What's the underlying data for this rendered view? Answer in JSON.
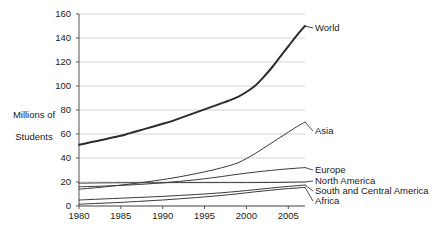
{
  "chart_data": {
    "type": "line",
    "title": "",
    "subtitle": "",
    "xlabel": "",
    "ylabel": "Millions of\nStudents",
    "xlim": [
      1980,
      2007
    ],
    "ylim": [
      0,
      160
    ],
    "grid": "horizontal",
    "legend_position": "right-inline-labels",
    "x_ticks": [
      "1980",
      "1985",
      "1990",
      "1995",
      "2000",
      "2005"
    ],
    "x_tick_values": [
      1980,
      1985,
      1990,
      1995,
      2000,
      2005
    ],
    "y_ticks": [
      "0",
      "20",
      "40",
      "60",
      "80",
      "100",
      "120",
      "140",
      "160"
    ],
    "y_tick_values": [
      0,
      20,
      40,
      60,
      80,
      100,
      120,
      140,
      160
    ],
    "x": [
      1980,
      1981,
      1982,
      1983,
      1984,
      1985,
      1986,
      1987,
      1988,
      1989,
      1990,
      1991,
      1992,
      1993,
      1994,
      1995,
      1996,
      1997,
      1998,
      1999,
      2000,
      2001,
      2002,
      2003,
      2004,
      2005,
      2006,
      2007
    ],
    "series": [
      {
        "name": "World",
        "color": "#2b2b2b",
        "width": 2.0,
        "label_x": 2007,
        "label_y": 150,
        "values": [
          51,
          52.5,
          54,
          55.5,
          57,
          58.5,
          60.5,
          62.5,
          64.5,
          66.5,
          68.5,
          70.5,
          73,
          75.5,
          78,
          80.5,
          83,
          85.5,
          88,
          91,
          95,
          100,
          107,
          115,
          124,
          133,
          142,
          150
        ]
      },
      {
        "name": "Asia",
        "color": "#3a3a3a",
        "width": 1.0,
        "label_x": 2007,
        "label_y": 70,
        "values": [
          14,
          14.6,
          15.2,
          15.9,
          16.6,
          17.4,
          18.2,
          19.1,
          20,
          21,
          22,
          23.1,
          24.3,
          25.6,
          27,
          28.5,
          30,
          31.8,
          33.7,
          36,
          39.5,
          43.5,
          48,
          52.5,
          57,
          61.5,
          66,
          70
        ]
      },
      {
        "name": "Europe",
        "color": "#3a3a3a",
        "width": 1.0,
        "label_x": 2007,
        "label_y": 32,
        "values": [
          16,
          16.2,
          16.4,
          16.6,
          16.9,
          17.2,
          17.5,
          17.9,
          18.3,
          18.8,
          19.3,
          19.9,
          20.5,
          21.2,
          21.9,
          22.7,
          23.6,
          24.5,
          25.5,
          26.5,
          27.4,
          28.2,
          29,
          29.7,
          30.4,
          31,
          31.5,
          32
        ]
      },
      {
        "name": "North America",
        "color": "#3a3a3a",
        "width": 1.0,
        "label_x": 2007,
        "label_y": 20,
        "values": [
          19,
          19.1,
          19.2,
          19.3,
          19.3,
          19.4,
          19.4,
          19.4,
          19.4,
          19.4,
          19.4,
          19.5,
          19.5,
          19.5,
          19.5,
          19.5,
          19.5,
          19.5,
          19.5,
          19.5,
          19.5,
          19.5,
          19.6,
          19.6,
          19.7,
          19.8,
          19.9,
          20
        ]
      },
      {
        "name": "South and Central America",
        "color": "#3a3a3a",
        "width": 1.0,
        "label_x": 2007,
        "label_y": 17.5,
        "values": [
          5,
          5.3,
          5.6,
          5.9,
          6.2,
          6.5,
          6.8,
          7.1,
          7.4,
          7.7,
          8,
          8.4,
          8.8,
          9.2,
          9.6,
          10,
          10.5,
          11,
          11.6,
          12.2,
          12.9,
          13.6,
          14.3,
          15,
          15.7,
          16.3,
          16.9,
          17.5
        ]
      },
      {
        "name": "Africa",
        "color": "#3a3a3a",
        "width": 1.0,
        "label_x": 2007,
        "label_y": 15.5,
        "values": [
          1.5,
          1.8,
          2.1,
          2.4,
          2.7,
          3,
          3.4,
          3.8,
          4.2,
          4.6,
          5,
          5.5,
          6,
          6.5,
          7,
          7.6,
          8.2,
          8.8,
          9.5,
          10.2,
          11,
          11.8,
          12.5,
          13.2,
          13.9,
          14.5,
          15,
          15.5
        ]
      }
    ]
  },
  "axis": {
    "y_title_line1": "Millions of",
    "y_title_line2": "Students"
  },
  "colors": {
    "gridline": "#c8c8c8",
    "axis": "#555555",
    "text": "#1a1a1a",
    "background": "#ffffff"
  }
}
